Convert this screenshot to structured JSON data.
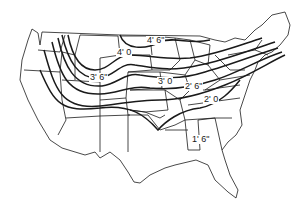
{
  "map": {
    "title": "Frost penetration depth contours, contiguous United States",
    "background": "#ffffff",
    "line_color": "#1a1a1a",
    "contour_labels": [
      {
        "text": "4' 6\"",
        "x": 146,
        "y": 36
      },
      {
        "text": "4' 0",
        "x": 116,
        "y": 48
      },
      {
        "text": "3' 6\"",
        "x": 89,
        "y": 73
      },
      {
        "text": "3' 0",
        "x": 157,
        "y": 77
      },
      {
        "text": "2' 6\"",
        "x": 184,
        "y": 82
      },
      {
        "text": "2' 0",
        "x": 203,
        "y": 95
      },
      {
        "text": "1' 6\"",
        "x": 191,
        "y": 135
      }
    ]
  }
}
